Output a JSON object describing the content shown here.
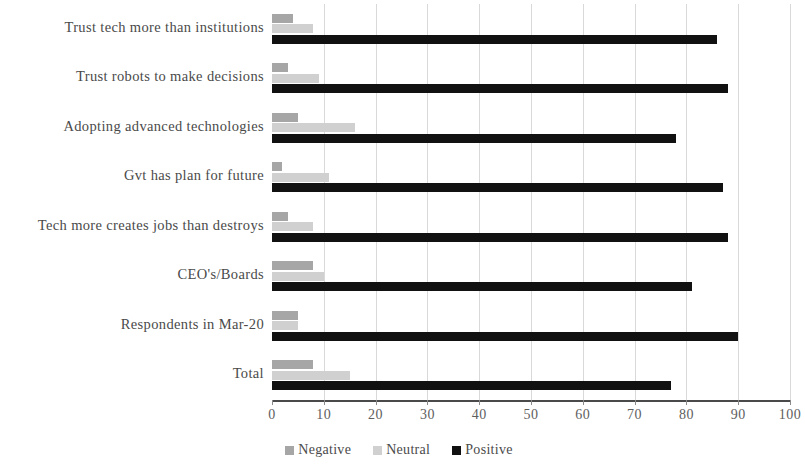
{
  "chart_data": {
    "type": "bar",
    "orientation": "horizontal",
    "title": "",
    "xlabel": "",
    "ylabel": "",
    "xlim": [
      0,
      100
    ],
    "xticks": [
      0,
      10,
      20,
      30,
      40,
      50,
      60,
      70,
      80,
      90,
      100
    ],
    "grid": true,
    "legend_position": "bottom",
    "categories": [
      "Trust tech more than institutions",
      "Trust robots to make decisions",
      "Adopting advanced technologies",
      "Gvt has plan for future",
      "Tech more creates jobs than destroys",
      "CEO's/Boards",
      "Respondents in Mar-20",
      "Total"
    ],
    "series": [
      {
        "name": "Negative",
        "color": "#a6a6a6",
        "values": [
          4,
          3,
          5,
          2,
          3,
          8,
          5,
          8
        ]
      },
      {
        "name": "Neutral",
        "color": "#d0d0d0",
        "values": [
          8,
          9,
          16,
          11,
          8,
          10,
          5,
          15
        ]
      },
      {
        "name": "Positive",
        "color": "#111111",
        "values": [
          86,
          88,
          78,
          87,
          88,
          81,
          90,
          77
        ]
      }
    ]
  }
}
